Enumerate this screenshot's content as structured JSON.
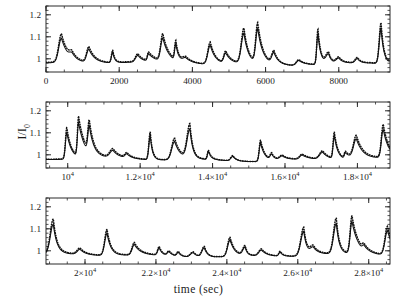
{
  "figure": {
    "ylabel": "I/I",
    "ylabel_sub": "0",
    "xlabel": "time (sec)"
  },
  "chart_data": {
    "type": "line",
    "title": "",
    "xlabel": "time (sec)",
    "ylabel": "I/I_0",
    "grid": false,
    "legend": false,
    "panels": [
      {
        "name": "panel-1",
        "xlim": [
          0,
          9400
        ],
        "ylim": [
          0.94,
          1.24
        ],
        "xticks": [
          0,
          2000,
          4000,
          6000,
          8000
        ],
        "xticklabels": [
          "0",
          "2000",
          "4000",
          "6000",
          "8000"
        ],
        "yticks": [
          1,
          1.1,
          1.2
        ],
        "yticklabels": [
          "1",
          "1.1",
          "1.2"
        ],
        "xminor_step": 500,
        "yminor_step": 0.02,
        "series": [
          {
            "name": "observed",
            "style": "solid",
            "x": [
              0,
              60,
              120,
              180,
              240,
              300,
              360,
              420,
              480,
              540,
              600,
              660,
              720,
              780,
              840,
              900,
              960,
              1020,
              1080,
              1140,
              1200,
              1260,
              1320,
              1380,
              1440,
              1500,
              1560,
              1620,
              1680,
              1740,
              1800,
              1860,
              1920,
              1980,
              2040,
              2100,
              2160,
              2220,
              2280,
              2340,
              2400,
              2460,
              2520,
              2580,
              2640,
              2700,
              2760,
              2820,
              2880,
              2940,
              3000,
              3060,
              3120,
              3180,
              3240,
              3300,
              3360,
              3420,
              3480,
              3540,
              3600,
              3660,
              3720,
              3780,
              3840,
              3900,
              3960,
              4020,
              4080,
              4140,
              4200,
              4260,
              4320,
              4380,
              4440,
              4500,
              4560,
              4620,
              4680,
              4740,
              4800,
              4860,
              4920,
              4980,
              5040,
              5100,
              5160,
              5220,
              5280,
              5340,
              5400,
              5460,
              5520,
              5580,
              5640,
              5700,
              5760,
              5820,
              5880,
              5940,
              6000,
              6060,
              6120,
              6180,
              6240,
              6300,
              6360,
              6420,
              6480,
              6540,
              6600,
              6660,
              6720,
              6780,
              6840,
              6900,
              6960,
              7020,
              7080,
              7140,
              7200,
              7260,
              7320,
              7380,
              7440,
              7500,
              7560,
              7620,
              7680,
              7740,
              7800,
              7860,
              7920,
              7980,
              8040,
              8100,
              8160,
              8220,
              8280,
              8340,
              8400,
              8460,
              8520,
              8580,
              8640,
              8700,
              8760,
              8820,
              8880,
              8940,
              9000,
              9060,
              9120,
              9180,
              9240,
              9300,
              9360
            ],
            "y": [
              0.975,
              0.968,
              0.972,
              0.98,
              0.988,
              0.995,
              1.002,
              1.01,
              1.02,
              1.032,
              1.042,
              1.036,
              1.024,
              1.012,
              1.002,
              0.994,
              0.988,
              0.984,
              0.982,
              0.984,
              0.99,
              0.998,
              1.008,
              1.016,
              1.012,
              1.004,
              0.996,
              0.988,
              0.982,
              0.98,
              0.984,
              0.996,
              1.018,
              1.048,
              1.082,
              1.1,
              1.076,
              1.042,
              1.014,
              0.996,
              0.986,
              0.98,
              0.976,
              0.974,
              0.976,
              0.982,
              0.99,
              1.0,
              1.01,
              1.016,
              1.012,
              1.004,
              0.996,
              0.99,
              0.986,
              0.984,
              0.986,
              0.992,
              1.0,
              1.01,
              1.018,
              1.022,
              1.018,
              1.01,
              1.0,
              0.992,
              0.986,
              0.982,
              0.98,
              0.98,
              0.984,
              0.992,
              1.004,
              1.018,
              1.03,
              1.036,
              1.03,
              1.018,
              1.006,
              0.996,
              0.988,
              0.982,
              0.978,
              0.976,
              0.978,
              0.984,
              0.996,
              1.016,
              1.046,
              1.078,
              1.098,
              1.08,
              1.046,
              1.016,
              0.998,
              0.988,
              0.982,
              0.978,
              0.976,
              0.978,
              0.984,
              0.994,
              1.006,
              1.016,
              1.022,
              1.018,
              1.008,
              0.998,
              0.99,
              0.984,
              0.98,
              0.98,
              0.986,
              0.998,
              1.018,
              1.044,
              1.068,
              1.078,
              1.062,
              1.034,
              1.01,
              0.994,
              0.984,
              0.978,
              0.976,
              0.976,
              0.98,
              0.988,
              0.998,
              1.01,
              1.02,
              1.026,
              1.022,
              1.014,
              1.004,
              0.996,
              0.99,
              0.986,
              0.984,
              0.986,
              0.992,
              1.002,
              1.014,
              1.024,
              1.028,
              1.022,
              1.012,
              1.002,
              0.994,
              0.988,
              0.984,
              0.984,
              0.988,
              0.998,
              1.012,
              1.03,
              1.048,
              1.058,
              1.05,
              1.032,
              1.012
            ]
          },
          {
            "name": "model",
            "style": "dotted",
            "offset_at_peaks": 0.012
          }
        ]
      },
      {
        "name": "panel-2",
        "xlim": [
          9400,
          18900
        ],
        "ylim": [
          0.94,
          1.24
        ],
        "xticks": [
          10000,
          12000,
          14000,
          16000,
          18000
        ],
        "xticklabels": [
          "10^4",
          "1.2×10^4",
          "1.4×10^4",
          "1.6×10^4",
          "1.8×10^4"
        ],
        "yticks": [
          1,
          1.1,
          1.2
        ],
        "yticklabels": [
          "1",
          "1.1",
          "1.2"
        ],
        "xminor_step": 500,
        "yminor_step": 0.02
      },
      {
        "name": "panel-3",
        "xlim": [
          18900,
          28600
        ],
        "ylim": [
          0.94,
          1.24
        ],
        "xticks": [
          20000,
          22000,
          24000,
          26000,
          28000
        ],
        "xticklabels": [
          "2×10^4",
          "2.2×10^4",
          "2.4×10^4",
          "2.6×10^4",
          "2.8×10^4"
        ],
        "yticks": [
          1,
          1.1,
          1.2
        ],
        "yticklabels": [
          "1",
          "1.1",
          "1.2"
        ],
        "xminor_step": 500,
        "yminor_step": 0.02
      }
    ],
    "colors": {
      "line": "#111111",
      "frame": "#2a2a2a",
      "background": "#ffffff"
    }
  }
}
